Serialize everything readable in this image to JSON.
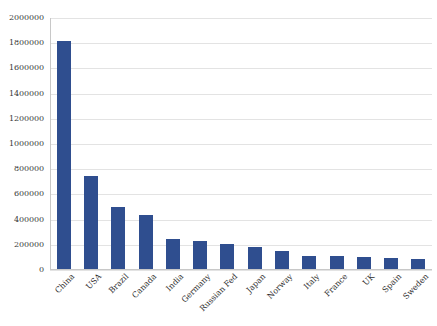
{
  "chart_data": {
    "type": "bar",
    "title": "",
    "xlabel": "",
    "ylabel": "",
    "ylim": [
      0,
      2000000
    ],
    "grid": true,
    "legend": "none",
    "bar_color": "#2f4e8f",
    "gridline_color": "#e3e3e3",
    "axis_color": "#c8c8c8",
    "y_ticks": [
      "0",
      "200000",
      "400000",
      "600000",
      "800000",
      "1000000",
      "1200000",
      "1400000",
      "1600000",
      "1800000",
      "2000000"
    ],
    "y_tick_values": [
      0,
      200000,
      400000,
      600000,
      800000,
      1000000,
      1200000,
      1400000,
      1600000,
      1800000,
      2000000
    ],
    "categories": [
      "China",
      "USA",
      "Brazil",
      "Canada",
      "India",
      "Germany",
      "Russian Fed",
      "Japan",
      "Norway",
      "Italy",
      "France",
      "UK",
      "Spain",
      "Sweden"
    ],
    "values": [
      1810000,
      740000,
      490000,
      425000,
      235000,
      225000,
      195000,
      175000,
      140000,
      105000,
      100000,
      95000,
      90000,
      80000
    ]
  }
}
